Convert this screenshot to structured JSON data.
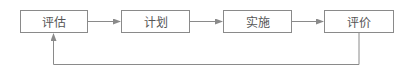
{
  "diagram": {
    "nodes": [
      {
        "id": "assess",
        "label": "评估"
      },
      {
        "id": "plan",
        "label": "计划"
      },
      {
        "id": "implement",
        "label": "实施"
      },
      {
        "id": "evaluate",
        "label": "评价"
      }
    ],
    "edges": [
      {
        "from": "assess",
        "to": "plan"
      },
      {
        "from": "plan",
        "to": "implement"
      },
      {
        "from": "implement",
        "to": "evaluate"
      },
      {
        "from": "evaluate",
        "to": "assess",
        "type": "feedback"
      }
    ],
    "colors": {
      "line": "#8a8a8a",
      "text": "#555555"
    }
  }
}
